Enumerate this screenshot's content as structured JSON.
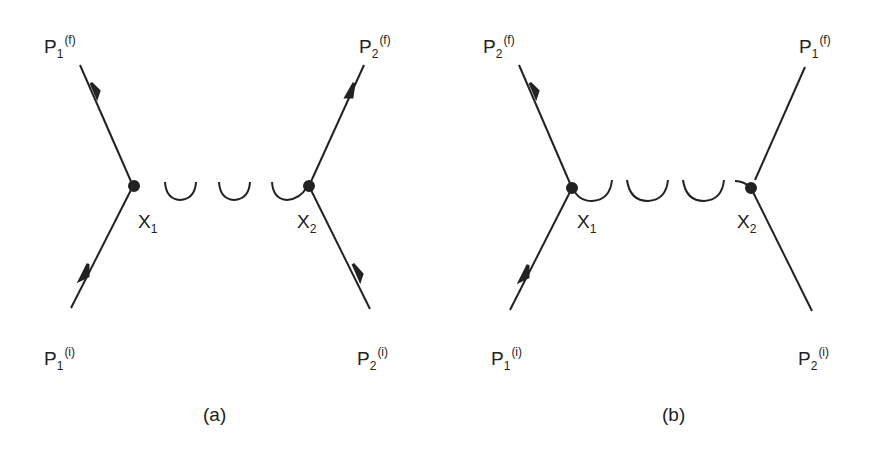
{
  "diagrams": [
    {
      "id": "a",
      "caption": "(a)",
      "labels": {
        "top_left": {
          "base": "P",
          "sub": "1",
          "sup": "(f)"
        },
        "top_right": {
          "base": "P",
          "sub": "2",
          "sup": "(f)"
        },
        "bottom_left": {
          "base": "P",
          "sub": "1",
          "sup": "(i)"
        },
        "bottom_right": {
          "base": "P",
          "sub": "2",
          "sup": "(i)"
        },
        "vertex_left": {
          "base": "X",
          "sub": "1"
        },
        "vertex_right": {
          "base": "X",
          "sub": "2"
        }
      },
      "propagator": "photon (wavy)",
      "arrows": [
        "top_left",
        "top_right",
        "bottom_left",
        "bottom_right"
      ]
    },
    {
      "id": "b",
      "caption": "(b)",
      "labels": {
        "top_left": {
          "base": "P",
          "sub": "2",
          "sup": "(f)"
        },
        "top_right": {
          "base": "P",
          "sub": "1",
          "sup": "(f)"
        },
        "bottom_left": {
          "base": "P",
          "sub": "1",
          "sup": "(i)"
        },
        "bottom_right": {
          "base": "P",
          "sub": "2",
          "sup": "(i)"
        },
        "vertex_left": {
          "base": "X",
          "sub": "1"
        },
        "vertex_right": {
          "base": "X",
          "sub": "2"
        }
      },
      "propagator": "photon (wavy)",
      "arrows": [
        "top_left",
        "bottom_left"
      ]
    }
  ],
  "colors": {
    "line": "#222222",
    "background": "#ffffff"
  }
}
